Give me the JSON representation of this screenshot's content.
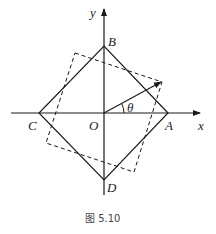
{
  "figure": {
    "caption": "图 5.10",
    "axes": {
      "x_label": "x",
      "y_label": "y",
      "origin_label": "O"
    },
    "angle_label": "θ",
    "points": {
      "A": "A",
      "B": "B",
      "C": "C",
      "D": "D"
    },
    "colors": {
      "stroke": "#1a1a1a",
      "text": "#222222"
    }
  }
}
